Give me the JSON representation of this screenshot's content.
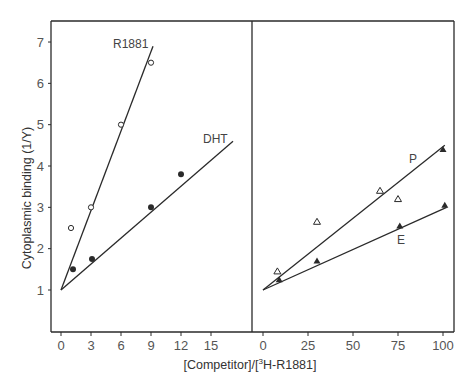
{
  "chart_data": [
    {
      "panel": "left",
      "type": "scatter",
      "xlabel": "[Competitor]/[3H-R1881]",
      "ylabel": "Cytoplasmic binding (1/Y)",
      "xlim": [
        -1,
        19
      ],
      "ylim": [
        0,
        7.5
      ],
      "xticks": [
        0,
        3,
        6,
        9,
        12,
        15
      ],
      "yticks": [
        1,
        2,
        3,
        4,
        5,
        6,
        7
      ],
      "grid": false,
      "series": [
        {
          "name": "R1881",
          "marker": "open-circle",
          "points": [
            [
              1,
              2.5
            ],
            [
              3,
              3.0
            ],
            [
              6,
              5.0
            ],
            [
              9,
              6.5
            ]
          ],
          "fit_line": [
            [
              0,
              1
            ],
            [
              9.2,
              6.9
            ]
          ]
        },
        {
          "name": "DHT",
          "marker": "filled-circle",
          "points": [
            [
              1.2,
              1.5
            ],
            [
              3.1,
              1.75
            ],
            [
              9,
              3.0
            ],
            [
              12,
              3.8
            ]
          ],
          "fit_line": [
            [
              0,
              1
            ],
            [
              17.2,
              4.6
            ]
          ]
        }
      ]
    },
    {
      "panel": "right",
      "type": "scatter",
      "xlabel": "[Competitor]/[3H-R1881]",
      "ylabel": "Cytoplasmic binding (1/Y)",
      "xlim": [
        -6,
        106
      ],
      "ylim": [
        0,
        7.5
      ],
      "xticks": [
        0,
        25,
        50,
        75,
        100
      ],
      "yticks": [
        1,
        2,
        3,
        4,
        5,
        6,
        7
      ],
      "grid": false,
      "series": [
        {
          "name": "P",
          "marker": "open-triangle",
          "points": [
            [
              8,
              1.45
            ],
            [
              30,
              2.65
            ],
            [
              65,
              3.4
            ],
            [
              75,
              3.2
            ]
          ],
          "fit_line": [
            [
              0,
              1
            ],
            [
              101,
              4.5
            ]
          ]
        },
        {
          "name": "P-filled",
          "marker": "filled-triangle",
          "points": [
            [
              100,
              4.4
            ]
          ],
          "fit_line": null
        },
        {
          "name": "E",
          "marker": "filled-triangle",
          "points": [
            [
              9,
              1.25
            ],
            [
              30,
              1.7
            ],
            [
              76,
              2.55
            ],
            [
              101,
              3.05
            ]
          ],
          "fit_line": [
            [
              0,
              1
            ],
            [
              102,
              3.0
            ]
          ]
        }
      ]
    }
  ],
  "labels": {
    "ylabel": "Cytoplasmic binding (1/Y)",
    "xlabel_prefix": "[Competitor]/[",
    "xlabel_sup": "3",
    "xlabel_suffix": "H-R1881]",
    "left_series": [
      "R1881",
      "DHT"
    ],
    "right_series": [
      "P",
      "E"
    ]
  },
  "colors": {
    "ink": "#2a2a2a",
    "text": "#444444",
    "background": "#ffffff"
  }
}
